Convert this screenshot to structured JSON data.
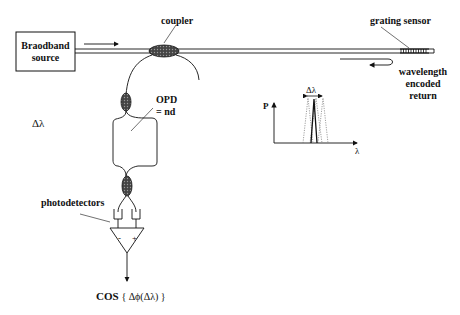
{
  "diagram": {
    "source_label_line1": "Braodband",
    "source_label_line2": "source",
    "coupler_label": "coupler",
    "grating_label": "grating sensor",
    "return_label_line1": "wavelength",
    "return_label_line2": "encoded",
    "return_label_line3": "return",
    "opd_label_line1": "OPD",
    "opd_label_line2": "= nd",
    "delta_lambda_label": "Δλ",
    "photodetectors_label": "photodetectors",
    "amp_minus": "-",
    "amp_plus": "+",
    "output_label_cos": "COS",
    "output_label_expr": "{ Δϕ(Δλ) }",
    "spectrum": {
      "y_axis_label": "P",
      "x_axis_label": "λ",
      "shift_label": "Δλ"
    },
    "colors": {
      "line": "#111111",
      "coupler_fill": "#333333",
      "dotted": "#777777"
    }
  }
}
